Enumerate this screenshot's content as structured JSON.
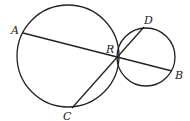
{
  "diagram": {
    "stroke_color": "#222222",
    "background": "#ffffff",
    "circles": [
      {
        "name": "large-circle",
        "cx": 68,
        "cy": 56,
        "r": 51
      },
      {
        "name": "small-circle",
        "cx": 146,
        "cy": 57,
        "r": 29
      }
    ],
    "segments": [
      {
        "name": "segment-AB",
        "from": "A",
        "to": "B"
      },
      {
        "name": "segment-CD",
        "from": "C",
        "to": "D"
      }
    ],
    "points": {
      "A": {
        "label": "A",
        "x": 23,
        "y": 33,
        "lx": 11,
        "ly": 34
      },
      "B": {
        "label": "B",
        "x": 172,
        "y": 71,
        "lx": 175,
        "ly": 79
      },
      "C": {
        "label": "C",
        "x": 72,
        "y": 108,
        "lx": 63,
        "ly": 120
      },
      "D": {
        "label": "D",
        "x": 144,
        "y": 27,
        "lx": 144,
        "ly": 24
      },
      "R": {
        "label": "R",
        "x": 117,
        "y": 57,
        "lx": 106,
        "ly": 53
      }
    }
  }
}
